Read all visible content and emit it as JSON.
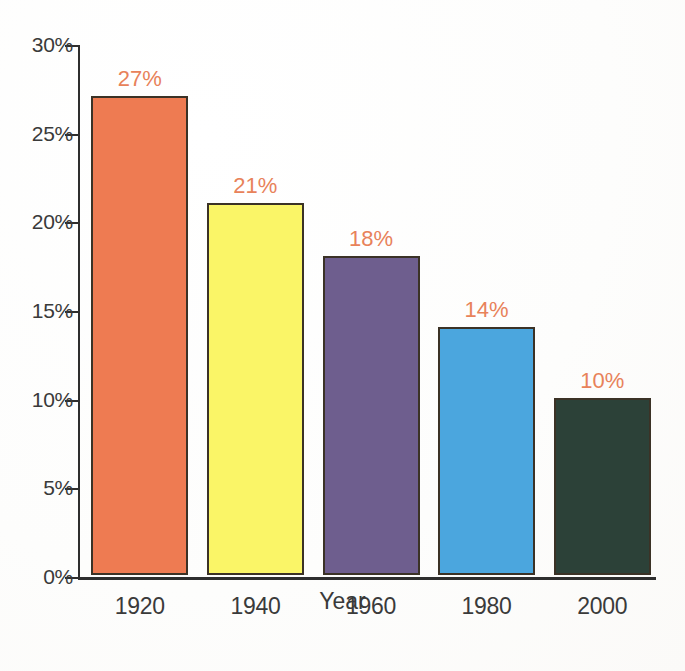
{
  "chart_data": {
    "type": "bar",
    "title": "",
    "subtitle": "",
    "categories": [
      "1920",
      "1940",
      "1960",
      "1980",
      "2000"
    ],
    "values": [
      27,
      21,
      18,
      14,
      10
    ],
    "data_labels": [
      "27%",
      "21%",
      "18%",
      "14%",
      "10%"
    ],
    "xlabel": "Year",
    "ylabel": "",
    "ylim": [
      0,
      30
    ],
    "ytick_values": [
      0,
      5,
      10,
      15,
      20,
      25,
      30
    ],
    "ytick_labels": [
      "0%",
      "5%",
      "10%",
      "15%",
      "20%",
      "25%",
      "30%"
    ],
    "grid": false,
    "legend": false,
    "legend_position": "none",
    "bar_colors": [
      "#ee7b52",
      "#faf567",
      "#6e5e8e",
      "#4ba6de",
      "#2c4138"
    ],
    "bar_outline_color": "#3b3226",
    "data_label_color": "#e8825a",
    "axis_color": "#2e2e2e",
    "tick_label_color": "#3a3a3a",
    "background_color": "#fefefe"
  }
}
